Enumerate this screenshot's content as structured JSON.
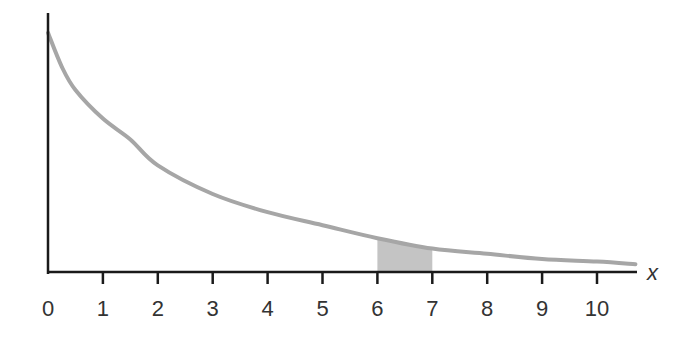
{
  "chart_data": {
    "type": "line",
    "title": "",
    "xlabel": "x",
    "ylabel": "",
    "xlim": [
      0,
      10.7
    ],
    "ylim": [
      0,
      1
    ],
    "grid": false,
    "legend": null,
    "x_ticks": [
      "0",
      "1",
      "2",
      "3",
      "4",
      "5",
      "6",
      "7",
      "8",
      "9",
      "10"
    ],
    "series": [
      {
        "name": "density curve",
        "color": "#a6a6a6",
        "x": [
          0,
          0.25,
          0.5,
          1,
          1.5,
          2,
          3,
          4,
          5,
          6,
          7,
          8,
          9,
          10,
          10.7
        ],
        "y": [
          0.92,
          0.79,
          0.7,
          0.59,
          0.51,
          0.41,
          0.3,
          0.23,
          0.18,
          0.13,
          0.09,
          0.07,
          0.05,
          0.04,
          0.03
        ]
      }
    ],
    "shaded_region": {
      "x_start": 6,
      "x_end": 7,
      "color": "#c4c4c4",
      "annotation": "area between x = 6 and x = 7"
    }
  },
  "axes": {
    "x_axis_label": "x",
    "tick_labels": [
      "0",
      "1",
      "2",
      "3",
      "4",
      "5",
      "6",
      "7",
      "8",
      "9",
      "10"
    ]
  },
  "colors": {
    "axis": "#1a1a1a",
    "curve": "#a6a6a6",
    "shade": "#c4c4c4",
    "text": "#333333"
  }
}
